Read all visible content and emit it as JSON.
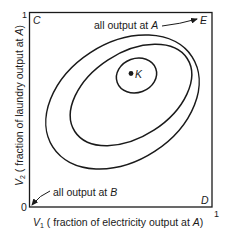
{
  "diagram": {
    "corners": {
      "top_left": "C",
      "top_right": "E",
      "bottom_right": "D"
    },
    "point": {
      "label": "K"
    },
    "annotations": {
      "top": {
        "text": "all output at ",
        "var": "A"
      },
      "bottom": {
        "text": "all output at ",
        "var": "B"
      }
    },
    "axes": {
      "origin_label": "0",
      "x_max_label": "1",
      "y_max_label": "1",
      "x_label": {
        "var": "V",
        "sub": "1",
        "text": " ( fraction of electricity output at ",
        "var2": "A",
        "close": ")"
      },
      "y_label": {
        "var": "V",
        "sub": "2",
        "text": " ( fraction of laundry output at ",
        "var2": "A",
        "close": ")"
      }
    },
    "contours": [
      {
        "name": "outer"
      },
      {
        "name": "middle"
      },
      {
        "name": "inner"
      }
    ],
    "colors": {
      "line": "#1a1a1a",
      "background": "#ffffff"
    }
  }
}
